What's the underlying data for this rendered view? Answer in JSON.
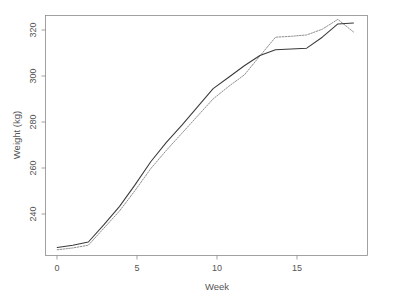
{
  "chart_data": {
    "type": "line",
    "title": "",
    "subtitle": "",
    "xlabel": "Week",
    "ylabel": "Weight (kg)",
    "xlim": [
      -0.75,
      19.9
    ],
    "ylim": [
      221.5,
      326.5
    ],
    "grid": false,
    "legend": null,
    "legend_position": "none",
    "x_ticks": [
      0,
      5,
      10,
      15
    ],
    "x_tick_labels": [
      "0",
      "5",
      "10",
      "15"
    ],
    "y_ticks": [
      240,
      260,
      280,
      300,
      320
    ],
    "y_tick_labels": [
      "240",
      "260",
      "280",
      "300",
      "320"
    ],
    "x": [
      0,
      1,
      2,
      3,
      4,
      5,
      6,
      7,
      8,
      9,
      10,
      11,
      12,
      13,
      14,
      15,
      16,
      17,
      18,
      19
    ],
    "series": [
      {
        "name": "series-solid",
        "style": "solid",
        "color": "#3a3a3a",
        "values": [
          225.0,
          226.0,
          227.4,
          235.0,
          243.0,
          252.5,
          262.5,
          271.0,
          278.5,
          286.5,
          294.5,
          299.5,
          304.5,
          309.0,
          311.5,
          311.8,
          312.2,
          317.0,
          322.8,
          323.2
        ]
      },
      {
        "name": "series-dotted",
        "style": "dotted",
        "color": "#8f8f8f",
        "values": [
          224.0,
          224.8,
          226.0,
          233.5,
          241.0,
          250.0,
          259.5,
          267.5,
          275.0,
          282.5,
          290.0,
          295.5,
          300.5,
          308.8,
          317.0,
          317.4,
          318.0,
          320.5,
          324.8,
          319.3
        ]
      }
    ],
    "annotations": []
  },
  "axes": {
    "y_axis_title": "Weight (kg)",
    "x_axis_title": "Week"
  }
}
